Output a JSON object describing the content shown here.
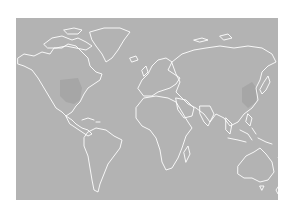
{
  "map": {
    "type": "world-outline",
    "background_color": "#b3b3b3",
    "coastline_color": "#ffffff",
    "highlight_color": "#a6a6a6",
    "highlighted_regions": [
      "central-united-states",
      "eastern-china"
    ]
  }
}
